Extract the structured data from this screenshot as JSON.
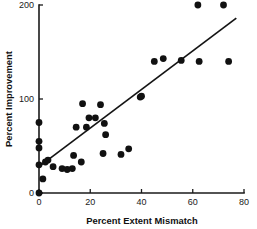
{
  "chart_data": {
    "type": "scatter",
    "title": "",
    "xlabel": "Percent Extent Mismatch",
    "ylabel": "Percent Improvement",
    "xlim": [
      0,
      80
    ],
    "ylim": [
      0,
      200
    ],
    "xticks": [
      0,
      20,
      40,
      60,
      80
    ],
    "yticks": [
      0,
      100,
      200
    ],
    "xtick_labels": [
      "0",
      "20",
      "40",
      "60",
      "80"
    ],
    "ytick_labels": [
      "0",
      "100",
      "200"
    ],
    "grid": false,
    "legend": null,
    "points": [
      [
        0,
        0
      ],
      [
        0,
        30
      ],
      [
        0,
        48
      ],
      [
        0,
        55
      ],
      [
        0,
        75
      ],
      [
        1.5,
        15
      ],
      [
        2.5,
        33
      ],
      [
        3.5,
        35
      ],
      [
        5.5,
        28
      ],
      [
        9,
        26
      ],
      [
        11,
        25
      ],
      [
        13,
        26
      ],
      [
        13.5,
        40
      ],
      [
        14.5,
        70
      ],
      [
        16.5,
        33
      ],
      [
        17,
        95
      ],
      [
        18.5,
        70
      ],
      [
        19.5,
        80
      ],
      [
        22,
        80
      ],
      [
        24,
        94
      ],
      [
        25,
        42
      ],
      [
        25.5,
        74
      ],
      [
        26,
        62
      ],
      [
        32,
        41
      ],
      [
        35,
        47
      ],
      [
        39.5,
        102
      ],
      [
        40,
        103
      ],
      [
        45,
        140
      ],
      [
        48.5,
        143
      ],
      [
        55.5,
        141
      ],
      [
        62,
        200
      ],
      [
        62.5,
        140
      ],
      [
        72,
        200
      ],
      [
        74,
        140
      ]
    ],
    "fit_line": {
      "x0": 0,
      "y0": 28,
      "x1": 77,
      "y1": 186
    },
    "marker": {
      "shape": "circle",
      "color": "#111111",
      "size": 3.4
    }
  }
}
